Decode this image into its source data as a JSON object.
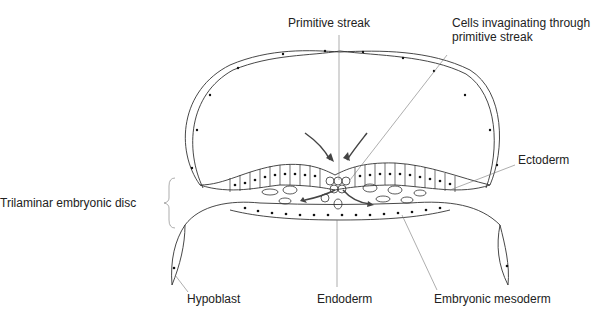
{
  "diagram": {
    "labels": {
      "primitive_streak": "Primitive streak",
      "cells_invaginating_1": "Cells invaginating through",
      "cells_invaginating_2": "primitive streak",
      "ectoderm": "Ectoderm",
      "trilaminar_disc": "Trilaminar embryonic disc",
      "hypoblast": "Hypoblast",
      "endoderm": "Endoderm",
      "embryonic_mesoderm": "Embryonic mesoderm"
    },
    "colors": {
      "line": "#333333",
      "leader": "#777777",
      "background": "#ffffff"
    }
  }
}
